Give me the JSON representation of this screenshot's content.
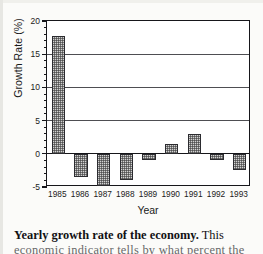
{
  "chart_data": {
    "type": "bar",
    "title": "",
    "xlabel": "Year",
    "ylabel": "Growth Rate (%)",
    "categories": [
      "1985",
      "1986",
      "1987",
      "1988",
      "1989",
      "1990",
      "1991",
      "1992",
      "1993"
    ],
    "values": [
      17.8,
      -3.5,
      -4.8,
      -4.0,
      -1.0,
      1.5,
      3.0,
      -1.0,
      -2.5
    ],
    "ylim": [
      -5,
      20
    ],
    "ytick_labels": [
      "20",
      "15",
      "10",
      "5",
      "0",
      "-5"
    ],
    "ytick_values": [
      20,
      15,
      10,
      5,
      0,
      -5
    ],
    "ytick_minor_step": 1,
    "grid": "horizontal",
    "legend": "none",
    "bar_fill": "halftone-dot-pattern",
    "bar_edge_color": "#2b2b2f",
    "zero_line": 0
  },
  "caption": {
    "lead": "Yearly growth rate of the economy.",
    "rest": " This",
    "line2": "economic indicator tells by what percent the"
  }
}
